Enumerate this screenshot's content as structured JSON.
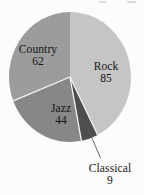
{
  "chart_data": {
    "type": "pie",
    "title": "",
    "total": 200,
    "start_angle_deg": 0,
    "direction": "clockwise",
    "legend_position": "none",
    "label_style": "inside labels with values; Classical labeled outside via leader line",
    "slices": [
      {
        "label": "Rock",
        "value": 85,
        "color": "#c5c5c5"
      },
      {
        "label": "Classical",
        "value": 9,
        "color": "#4e4e4e"
      },
      {
        "label": "Jazz",
        "value": 44,
        "color": "#878787"
      },
      {
        "label": "Country",
        "value": 62,
        "color": "#9c9c9c"
      }
    ],
    "colors": {
      "separator_line": "#f4f4f4",
      "leader_line": "#5a5a5a",
      "label_text": "#141414",
      "background": "#fcfcfc"
    }
  }
}
